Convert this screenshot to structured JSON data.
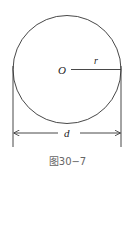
{
  "figure": {
    "caption": "图30−7",
    "labels": {
      "center": "O",
      "radius": "r",
      "diameter": "d"
    },
    "colors": {
      "stroke": "#333333",
      "caption": "#666666"
    },
    "geometry": {
      "circle_center": [
        67,
        69.5
      ],
      "circle_radius": 54,
      "dimension_line_y": 133
    }
  }
}
